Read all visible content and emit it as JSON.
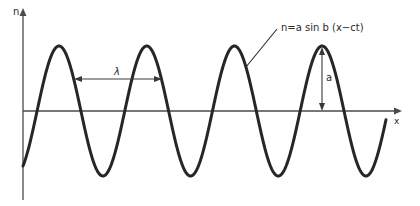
{
  "diagram": {
    "type": "sinusoidal-wave",
    "y_axis_label": "n",
    "x_axis_label": "x",
    "wavelength_label": "λ",
    "amplitude_label": "a",
    "equation_label": "n=a sin b (x−ct)",
    "colors": {
      "curve": "#262626",
      "axes": "#4a4a4a",
      "annotation": "#3a3a3a",
      "background": "#ffffff"
    },
    "geometry": {
      "origin_x": 23,
      "axis_y": 111,
      "x_axis_end": 400,
      "y_axis_top": 10,
      "y_axis_bottom": 200,
      "amplitude_px": 65,
      "wavelength_px": 87.7,
      "first_peak_x": 59,
      "curve_start_x": 23,
      "curve_end_x": 386
    },
    "peaks_x": [
      59,
      147,
      234,
      322
    ],
    "troughs_x": [
      101,
      189,
      277,
      364
    ]
  }
}
